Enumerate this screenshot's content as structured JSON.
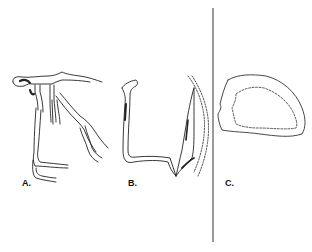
{
  "figure": {
    "panels": [
      {
        "id": "A",
        "label": "A.",
        "description": "branching vessel/root-like tubular structure"
      },
      {
        "id": "B",
        "label": "B.",
        "description": "bent tubular structure with adjacent elongated outline and dotted boundary"
      },
      {
        "id": "C",
        "label": "C.",
        "description": "rounded closed outline with inner dashed contour"
      }
    ],
    "colors": {
      "stroke": "#222222",
      "divider": "#9a9a9a",
      "background": "#ffffff"
    }
  }
}
